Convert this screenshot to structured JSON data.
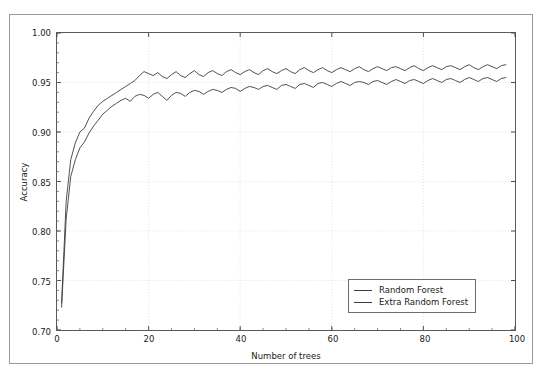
{
  "page_bleed_text": "",
  "chart_data": {
    "type": "line",
    "title": "",
    "xlabel": "Number of trees",
    "ylabel": "Accuracy",
    "xlim": [
      0,
      100
    ],
    "ylim": [
      0.7,
      1.0
    ],
    "xticks": [
      0,
      20,
      40,
      60,
      80,
      100
    ],
    "xtick_labels": [
      "0",
      "20",
      "40",
      "60",
      "80",
      "100"
    ],
    "yticks": [
      0.7,
      0.75,
      0.8,
      0.85,
      0.9,
      0.95,
      1.0
    ],
    "ytick_labels": [
      "0.70",
      "0.75",
      "0.80",
      "0.85",
      "0.90",
      "0.95",
      "1.00"
    ],
    "grid": true,
    "grid_style": "dotted",
    "legend_position": "lower right",
    "line_color": "#3c3c3c",
    "x": [
      1,
      2,
      3,
      4,
      5,
      6,
      7,
      8,
      9,
      10,
      11,
      12,
      13,
      14,
      15,
      16,
      17,
      18,
      19,
      20,
      21,
      22,
      23,
      24,
      25,
      26,
      27,
      28,
      29,
      30,
      31,
      32,
      33,
      34,
      35,
      36,
      37,
      38,
      39,
      40,
      41,
      42,
      43,
      44,
      45,
      46,
      47,
      48,
      49,
      50,
      51,
      52,
      53,
      54,
      55,
      56,
      57,
      58,
      59,
      60,
      61,
      62,
      63,
      64,
      65,
      66,
      67,
      68,
      69,
      70,
      71,
      72,
      73,
      74,
      75,
      76,
      77,
      78,
      79,
      80,
      81,
      82,
      83,
      84,
      85,
      86,
      87,
      88,
      89,
      90,
      91,
      92,
      93,
      94,
      95,
      96,
      97,
      98
    ],
    "series": [
      {
        "name": "Random Forest",
        "values": [
          0.723,
          0.812,
          0.855,
          0.872,
          0.884,
          0.89,
          0.899,
          0.906,
          0.912,
          0.918,
          0.922,
          0.926,
          0.929,
          0.932,
          0.934,
          0.931,
          0.936,
          0.938,
          0.937,
          0.934,
          0.938,
          0.94,
          0.936,
          0.932,
          0.937,
          0.94,
          0.939,
          0.936,
          0.94,
          0.942,
          0.941,
          0.938,
          0.941,
          0.943,
          0.942,
          0.94,
          0.943,
          0.945,
          0.944,
          0.941,
          0.944,
          0.946,
          0.945,
          0.943,
          0.946,
          0.947,
          0.945,
          0.943,
          0.947,
          0.948,
          0.946,
          0.944,
          0.948,
          0.949,
          0.947,
          0.945,
          0.949,
          0.95,
          0.948,
          0.946,
          0.949,
          0.951,
          0.949,
          0.947,
          0.95,
          0.951,
          0.95,
          0.948,
          0.951,
          0.952,
          0.95,
          0.948,
          0.951,
          0.953,
          0.951,
          0.949,
          0.952,
          0.953,
          0.951,
          0.949,
          0.952,
          0.954,
          0.952,
          0.95,
          0.953,
          0.954,
          0.952,
          0.95,
          0.953,
          0.955,
          0.953,
          0.951,
          0.954,
          0.955,
          0.953,
          0.951,
          0.954,
          0.955
        ]
      },
      {
        "name": "Extra Random Forest",
        "values": [
          0.727,
          0.83,
          0.872,
          0.889,
          0.9,
          0.904,
          0.914,
          0.921,
          0.927,
          0.931,
          0.934,
          0.937,
          0.94,
          0.943,
          0.946,
          0.949,
          0.952,
          0.957,
          0.961,
          0.959,
          0.957,
          0.96,
          0.956,
          0.954,
          0.958,
          0.961,
          0.957,
          0.955,
          0.959,
          0.962,
          0.958,
          0.956,
          0.96,
          0.962,
          0.959,
          0.957,
          0.961,
          0.963,
          0.96,
          0.958,
          0.961,
          0.963,
          0.96,
          0.958,
          0.962,
          0.964,
          0.961,
          0.959,
          0.962,
          0.964,
          0.961,
          0.959,
          0.963,
          0.965,
          0.962,
          0.96,
          0.963,
          0.965,
          0.962,
          0.96,
          0.963,
          0.965,
          0.963,
          0.961,
          0.964,
          0.966,
          0.963,
          0.961,
          0.964,
          0.966,
          0.964,
          0.962,
          0.965,
          0.966,
          0.964,
          0.962,
          0.965,
          0.967,
          0.964,
          0.962,
          0.965,
          0.967,
          0.965,
          0.963,
          0.966,
          0.967,
          0.965,
          0.963,
          0.966,
          0.968,
          0.965,
          0.963,
          0.966,
          0.968,
          0.966,
          0.964,
          0.967,
          0.968
        ]
      }
    ]
  }
}
